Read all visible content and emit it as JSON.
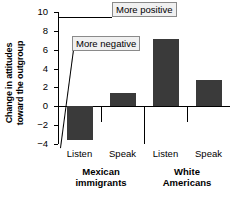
{
  "chart_data": {
    "type": "bar",
    "title": "",
    "xlabel": "",
    "ylabel_line1": "Change in attitudes",
    "ylabel_line2": "toward the outgroup",
    "ylim": [
      -4,
      10
    ],
    "yticks": [
      10,
      8,
      6,
      4,
      2,
      0,
      -2,
      -4
    ],
    "ytick_labels": [
      "10",
      "8",
      "6",
      "4",
      "2",
      "0",
      "−2",
      "−4"
    ],
    "grid": false,
    "legend": "none",
    "groups": [
      {
        "name": "Mexican immigrants",
        "name_line1": "Mexican",
        "name_line2": "immigrants"
      },
      {
        "name": "White Americans",
        "name_line1": "White",
        "name_line2": "Americans"
      }
    ],
    "categories": [
      "Listen",
      "Speak",
      "Listen",
      "Speak"
    ],
    "values": [
      -3.6,
      1.4,
      7.1,
      2.8
    ],
    "bars": [
      {
        "group": "Mexican immigrants",
        "category": "Listen",
        "value": -3.6
      },
      {
        "group": "Mexican immigrants",
        "category": "Speak",
        "value": 1.4
      },
      {
        "group": "White Americans",
        "category": "Listen",
        "value": 7.1
      },
      {
        "group": "White Americans",
        "category": "Speak",
        "value": 2.8
      }
    ],
    "annotations": [
      {
        "text": "More positive",
        "points_to_value": 10
      },
      {
        "text": "More negative",
        "points_to_value": -4
      }
    ],
    "colors": {
      "bar": "#3a3a3a",
      "axis": "#000000",
      "callout_fill": "#f0f0f0",
      "callout_border": "#8a8a8a",
      "background": "#ffffff"
    }
  }
}
